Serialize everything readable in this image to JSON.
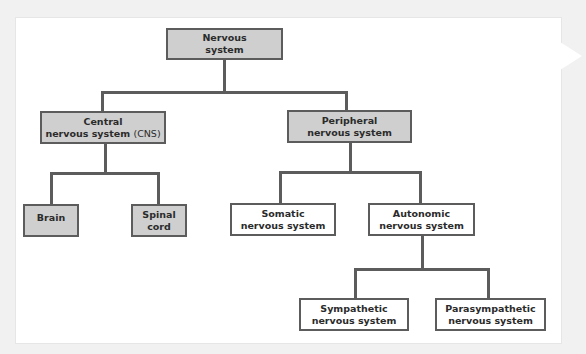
{
  "diagram": {
    "colors": {
      "filled_node": "#cfcfcf",
      "empty_node": "#ffffff",
      "line": "#5c5c5c",
      "text": "#2b2b2b"
    },
    "nodes": {
      "root": {
        "line1": "Nervous",
        "line2": "system"
      },
      "cns": {
        "line1": "Central",
        "line2": "nervous system",
        "abbr": "(CNS)"
      },
      "pns": {
        "line1": "Peripheral",
        "line2": "nervous system"
      },
      "brain": {
        "line1": "Brain"
      },
      "spinal": {
        "line1": "Spinal",
        "line2": "cord"
      },
      "somatic": {
        "line1": "Somatic",
        "line2": "nervous system"
      },
      "autonomic": {
        "line1": "Autonomic",
        "line2": "nervous system"
      },
      "sympathetic": {
        "line1": "Sympathetic",
        "line2": "nervous system"
      },
      "parasympathetic": {
        "line1": "Parasympathetic",
        "line2": "nervous system"
      }
    }
  }
}
